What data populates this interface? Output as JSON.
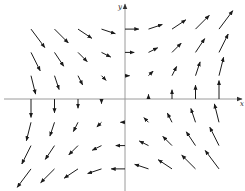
{
  "diagram": {
    "title": "",
    "type": "vector_field",
    "field": {
      "Fx": "y",
      "Fy": "x",
      "description": "F(x, y) = y i + x j"
    },
    "axes": {
      "x_label": "x",
      "y_label": "y",
      "origin_px": [
        125,
        99
      ],
      "unit_px": [
        23.5,
        23.3
      ],
      "x_axis_extent_px": [
        4,
        242
      ],
      "y_axis_extent_px": [
        4,
        191
      ],
      "axis_color": "#9a9a9a"
    },
    "grid": {
      "x_values": [
        -4,
        -3,
        -2,
        -1,
        0,
        1,
        2,
        3,
        4
      ],
      "y_values": [
        3,
        2,
        1,
        0,
        -1,
        -2,
        -3
      ]
    },
    "arrow_scale_px_per_unit": 4.6,
    "arrow_color": "#1a1a1a"
  }
}
